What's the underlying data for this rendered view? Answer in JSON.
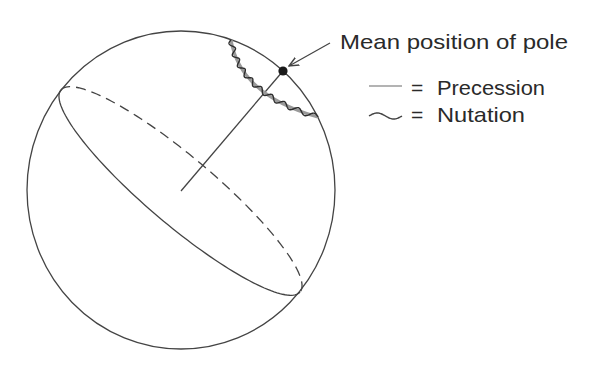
{
  "figure": {
    "type": "diagram",
    "colors": {
      "background": "#ffffff",
      "outline": "#444444",
      "precession": "#9a9a9a",
      "nutation": "#2e2e2e",
      "pole": "#1a1a1a",
      "text": "#2a2a2a"
    }
  },
  "sphere": {
    "cx": 181,
    "cy": 190,
    "rx": 154,
    "ry": 159
  },
  "equator": {
    "cx": 180.5,
    "cy": 191,
    "rx": 156.5,
    "ry": 34,
    "rotation_deg": 40.2,
    "front_style": "solid",
    "back_style": "dashed"
  },
  "axis": {
    "from": [
      181,
      191
    ],
    "to": [
      283,
      71
    ]
  },
  "pole": {
    "cx": 283,
    "cy": 71,
    "r": 4.6
  },
  "precession_path": {
    "start": [
      231,
      40
    ],
    "control": [
      240,
      95
    ],
    "end": [
      318,
      117
    ]
  },
  "nutation_wave": {
    "cycles": 9,
    "amplitude": 2.6
  },
  "annotation": {
    "text": "Mean position of pole",
    "x": 340,
    "y": 49,
    "arrow_from": [
      330,
      43
    ],
    "arrow_to": [
      289,
      66
    ]
  },
  "legend": {
    "items": [
      {
        "symbol": "straight-line",
        "equals": "=",
        "label": "Precession",
        "y": 95
      },
      {
        "symbol": "wavy-line",
        "equals": "=",
        "label": "Nutation",
        "y": 122
      }
    ]
  }
}
